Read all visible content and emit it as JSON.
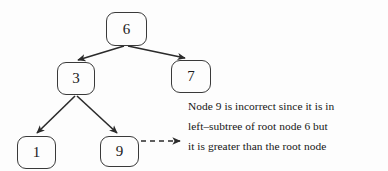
{
  "diagram": {
    "background_color": "#fdfdfd",
    "stroke_color": "#2b2b2b",
    "text_color": "#161616",
    "nodes": [
      {
        "id": "root",
        "label": "6",
        "x": 106,
        "y": 12,
        "w": 41,
        "h": 34
      },
      {
        "id": "left-child",
        "label": "3",
        "x": 57,
        "y": 62,
        "w": 38,
        "h": 33
      },
      {
        "id": "right-child",
        "label": "7",
        "x": 171,
        "y": 60,
        "w": 40,
        "h": 33
      },
      {
        "id": "leaf-one",
        "label": "1",
        "x": 17,
        "y": 136,
        "w": 39,
        "h": 33
      },
      {
        "id": "leaf-nine",
        "label": "9",
        "x": 100,
        "y": 136,
        "w": 39,
        "h": 31
      }
    ],
    "edges": [
      {
        "id": "root-to-left",
        "from": "root",
        "to": "left-child",
        "style": "solid",
        "x1": 124,
        "y1": 46,
        "x2": 77,
        "y2": 60
      },
      {
        "id": "root-to-right",
        "from": "root",
        "to": "right-child",
        "style": "solid",
        "x1": 128,
        "y1": 46,
        "x2": 186,
        "y2": 58
      },
      {
        "id": "left-to-one",
        "from": "left-child",
        "to": "leaf-one",
        "style": "solid",
        "x1": 75,
        "y1": 96,
        "x2": 37,
        "y2": 134
      },
      {
        "id": "left-to-nine",
        "from": "left-child",
        "to": "leaf-nine",
        "style": "solid",
        "x1": 77,
        "y1": 96,
        "x2": 117,
        "y2": 134
      },
      {
        "id": "nine-to-note",
        "from": "leaf-nine",
        "to": "annotation",
        "style": "dashed",
        "x1": 140,
        "y1": 141,
        "x2": 181,
        "y2": 141
      }
    ],
    "annotation": {
      "lines": [
        "Node 9 is incorrect since it is in",
        "left–subtree of root node 6 but",
        "it is greater than the root node"
      ],
      "line1": "Node 9 is incorrect since it is in",
      "line2": "left–subtree of root node 6 but",
      "line3": "it is greater than the root node"
    }
  }
}
